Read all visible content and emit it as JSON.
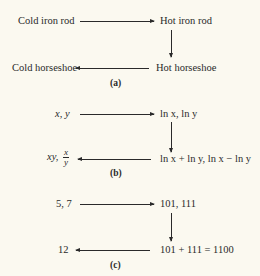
{
  "panels": [
    {
      "caption": "(a)",
      "top_left": "Cold iron rod",
      "top_right": "Hot iron rod",
      "bottom_right": "Hot  horseshoe",
      "bottom_left": "Cold horseshoe"
    },
    {
      "caption": "(b)",
      "top_left": "x, y",
      "top_right": "ln x, ln y",
      "bottom_right": "ln x + ln y, ln x − ln y",
      "bottom_left_prefix": "xy,",
      "bottom_left_frac_num": "x",
      "bottom_left_frac_den": "y"
    },
    {
      "caption": "(c)",
      "top_left": "5, 7",
      "top_right": "101, 111",
      "bottom_right": "101 + 111 = 1100",
      "bottom_left": "12"
    }
  ],
  "colors": {
    "background": "#fbf9f0",
    "ink": "#2a2a2a"
  }
}
